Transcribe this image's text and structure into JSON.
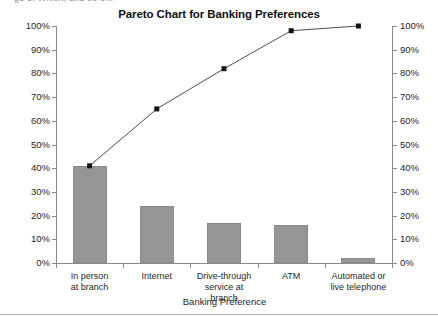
{
  "clipped_top_text": "ge 3: Which, and so on.",
  "chart_data": {
    "type": "bar",
    "title": "Pareto Chart for Banking Preferences",
    "xlabel": "Banking Preference",
    "ylabel": "",
    "ylim": [
      0,
      100
    ],
    "y2lim": [
      0,
      100
    ],
    "grid": false,
    "legend": "none",
    "categories": [
      "In person\nat branch",
      "Internet",
      "Drive-through\nservice at branch",
      "ATM",
      "Automated or\nlive telephone"
    ],
    "series": [
      {
        "name": "Percent",
        "type": "bar",
        "values": [
          41,
          24,
          17,
          16,
          2
        ]
      },
      {
        "name": "Cumulative percent",
        "type": "line",
        "values": [
          41,
          65,
          82,
          98,
          100
        ]
      }
    ],
    "ytick_labels": [
      "100%",
      "90%",
      "80%",
      "70%",
      "60%",
      "50%",
      "40%",
      "30%",
      "20%",
      "10%",
      "0%"
    ],
    "y2tick_labels": [
      "100%",
      "90%",
      "80%",
      "70%",
      "60%",
      "50%",
      "40%",
      "30%",
      "20%",
      "10%",
      "0%"
    ],
    "ytick_values": [
      100,
      90,
      80,
      70,
      60,
      50,
      40,
      30,
      20,
      10,
      0
    ],
    "bar_color": "#969696",
    "line_color": "#4d4d4d",
    "marker_color": "#111111",
    "axis_color": "#8a8a8a"
  }
}
